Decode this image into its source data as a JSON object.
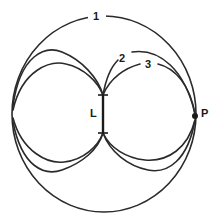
{
  "diagram": {
    "labels": {
      "curve_1": "1",
      "curve_2": "2",
      "curve_3": "3",
      "segment": "L",
      "point": "P"
    },
    "colors": {
      "line": "#2a2a2a",
      "background": "#ffffff"
    }
  }
}
